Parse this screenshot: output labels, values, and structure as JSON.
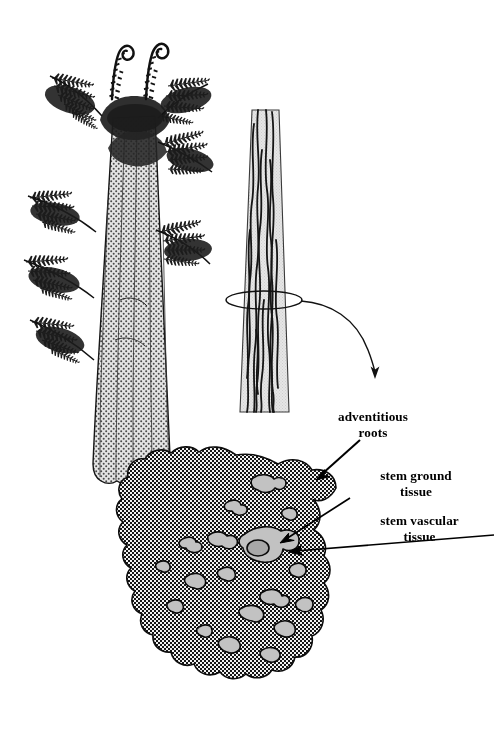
{
  "figure": {
    "background_color": "#ffffff",
    "ink_color": "#000000",
    "tissue_fill_color": "#9a9a9a",
    "trunk_fill_color": "#d8d8d8",
    "stem_fill_color": "#dcdcdc",
    "bundle_fill_color": "#b5b5b5"
  },
  "labels": {
    "adventitious_roots": "adventitious\nroots",
    "stem_ground_tissue": "stem ground\ntissue",
    "stem_vascular_tissue": "stem vascular\ntissue"
  },
  "panels": {
    "habit": {
      "name": "tree-fern-habit-illustration",
      "description": "tree fern with crown of fronds, two fiddleheads and stippled trunk"
    },
    "longitudinal": {
      "name": "stem-longitudinal-illustration",
      "description": "tapered stem column with wavy vascular strands and cut-plane ring"
    },
    "cross_section": {
      "name": "stem-cross-section-illustration",
      "description": "lobed stem cross section with stippled ground tissue and scattered vascular bundles"
    }
  },
  "annotations": {
    "cut_plane_ring": "cut-plane-ring",
    "section_arrow": "curved-section-arrow",
    "leader_adventitious_roots": "leader-line-adventitious-roots",
    "leader_stem_ground_tissue": "leader-line-stem-ground-tissue",
    "leader_stem_vascular_tissue": "leader-line-stem-vascular-tissue"
  }
}
